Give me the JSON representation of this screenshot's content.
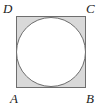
{
  "figure": {
    "kind": "geometry-diagram",
    "square": {
      "name": "square-ABCD",
      "x": 16,
      "y": 16,
      "width": 70,
      "height": 72,
      "fill_color": "#d9d9d9",
      "stroke_color": "#6e6e6e",
      "stroke_width": 1
    },
    "circle": {
      "name": "inscribed-circle",
      "cx": 51,
      "cy": 52,
      "r": 35,
      "fill_color": "#ffffff",
      "stroke_color": "#6e6e6e",
      "stroke_width": 1
    },
    "labels": {
      "top_left": "D",
      "top_right": "C",
      "bottom_left": "A",
      "bottom_right": "B"
    },
    "label_color": "#1c1c1c",
    "background_color": "#ffffff"
  }
}
